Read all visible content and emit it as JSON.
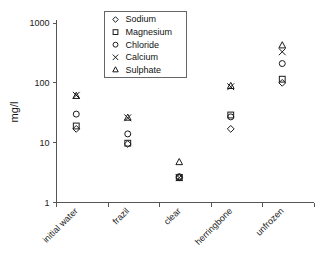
{
  "chart_data": {
    "type": "scatter",
    "title": "",
    "xlabel": "",
    "ylabel": "mg/l",
    "yscale": "log",
    "ylim": [
      1,
      1000
    ],
    "ytick_labels": [
      "1",
      "10",
      "100",
      "1000"
    ],
    "ytick_values": [
      1,
      10,
      100,
      1000
    ],
    "grid": false,
    "legend_position": "top-center",
    "categories": [
      "initial water",
      "frazil",
      "clear",
      "herringbone",
      "unfrozen"
    ],
    "series": [
      {
        "name": "Sodium",
        "marker": "diamond",
        "values": [
          17,
          9.5,
          2.6,
          17,
          100
        ]
      },
      {
        "name": "Magnesium",
        "marker": "square",
        "values": [
          19,
          9.8,
          2.6,
          29,
          115
        ]
      },
      {
        "name": "Chloride",
        "marker": "circle",
        "values": [
          30,
          14,
          2.7,
          27,
          210
        ]
      },
      {
        "name": "Calcium",
        "marker": "cross",
        "values": [
          62,
          26,
          2.6,
          86,
          330
        ]
      },
      {
        "name": "Sulphate",
        "marker": "triangle",
        "values": [
          60,
          26,
          4.7,
          88,
          420
        ]
      }
    ]
  },
  "legend": {
    "entries": [
      {
        "label": "Sodium",
        "marker": "diamond"
      },
      {
        "label": "Magnesium",
        "marker": "square"
      },
      {
        "label": "Chloride",
        "marker": "circle"
      },
      {
        "label": "Calcium",
        "marker": "cross"
      },
      {
        "label": "Sulphate",
        "marker": "triangle"
      }
    ]
  },
  "axes": {
    "y_title": "mg/l",
    "y_ticks": [
      "1000",
      "100",
      "10",
      "1"
    ],
    "x_ticks": [
      "initial water",
      "frazil",
      "clear",
      "herringbone",
      "unfrozen"
    ]
  },
  "colors": {
    "marker": "#1a1a1a",
    "axis": "#555555",
    "legend_border": "#666666",
    "background": "#ffffff"
  }
}
